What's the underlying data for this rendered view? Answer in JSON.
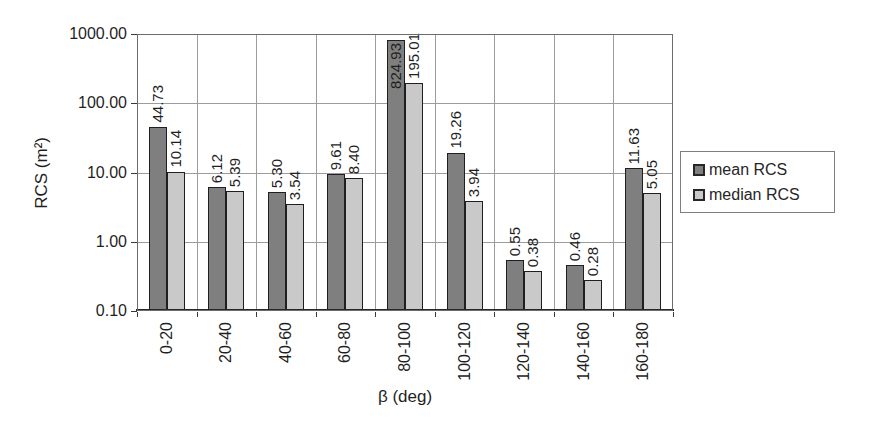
{
  "chart_data": {
    "type": "bar",
    "title": "",
    "xlabel": "β (deg)",
    "ylabel": "RCS (m²)",
    "y_scale": "log",
    "ylim": [
      0.1,
      1000
    ],
    "y_tick_values": [
      1000,
      100,
      10,
      1,
      0.1
    ],
    "y_tick_labels": [
      "1000.00",
      "100.00",
      "10.00",
      "1.00",
      "0.10"
    ],
    "grid": true,
    "legend_position": "right",
    "categories": [
      "0-20",
      "20-40",
      "40-60",
      "60-80",
      "80-100",
      "100-120",
      "120-140",
      "140-160",
      "160-180"
    ],
    "series": [
      {
        "name": "mean RCS",
        "color": "#7f7f7f",
        "values": [
          44.73,
          6.12,
          5.3,
          9.61,
          824.93,
          19.26,
          0.55,
          0.46,
          11.63
        ]
      },
      {
        "name": "median RCS",
        "color": "#c9c9c9",
        "values": [
          10.14,
          5.39,
          3.54,
          8.4,
          195.01,
          3.94,
          0.38,
          0.28,
          5.05
        ]
      }
    ]
  }
}
